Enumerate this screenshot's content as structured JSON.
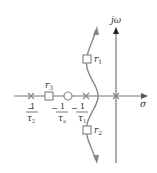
{
  "diagram": {
    "type": "root-locus",
    "axes": {
      "imag_label": "jω",
      "real_label": "σ"
    },
    "colors": {
      "locus": "#888888",
      "axis": "#777777"
    },
    "points": {
      "r1": "r",
      "r1_sub": "1",
      "r2": "r",
      "r2_sub": "2",
      "r3": "r",
      "r3_sub": "3"
    },
    "ticks": [
      {
        "name": "tau2",
        "num": "1",
        "sign": "−",
        "den": "τ",
        "den_sub": "2"
      },
      {
        "name": "taua",
        "num": "1",
        "sign": "−",
        "den": "τ",
        "den_sub": "a"
      },
      {
        "name": "tau1",
        "num": "1",
        "sign": "−",
        "den": "τ",
        "den_sub": "1"
      }
    ]
  }
}
